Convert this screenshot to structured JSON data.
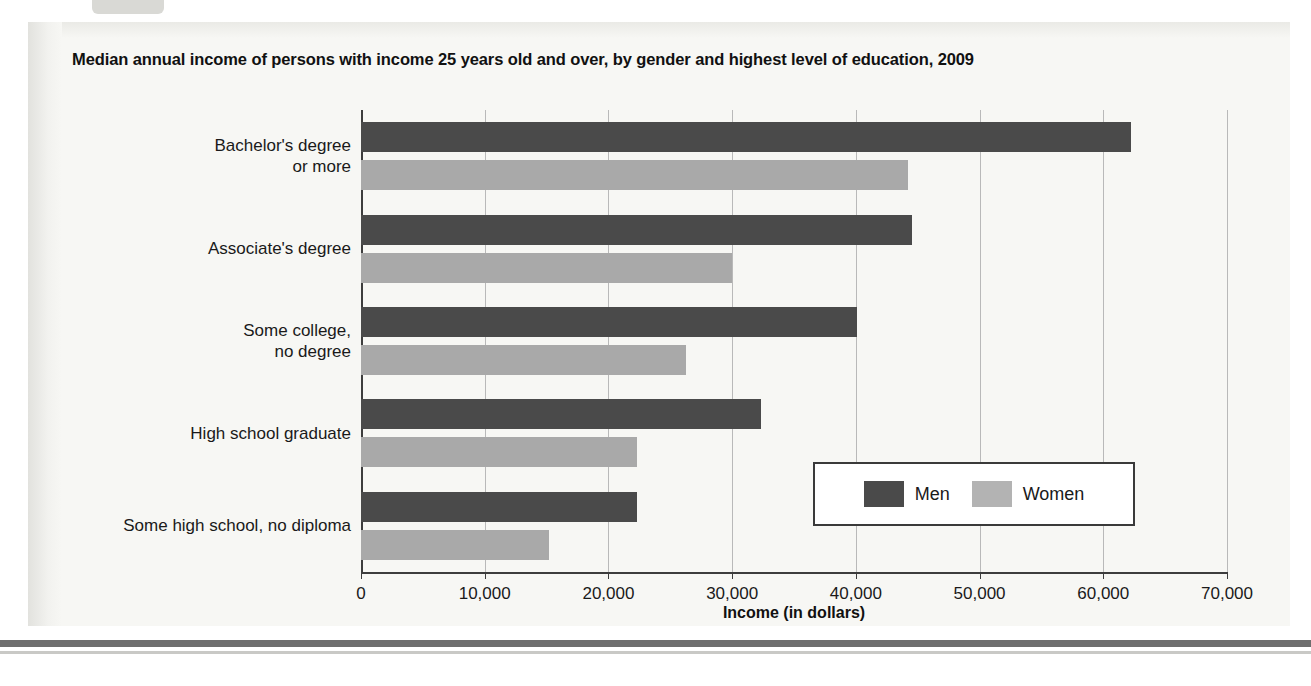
{
  "figure": {
    "title": "Median annual income of persons with income 25 years old and over, by gender and highest level of education, 2009"
  },
  "chart_data": {
    "type": "bar",
    "orientation": "horizontal",
    "title": "Median annual income of persons with income 25 years old and over, by gender and highest level of education, 2009",
    "xlabel": "Income (in dollars)",
    "ylabel": "",
    "xlim": [
      0,
      70000
    ],
    "xticks": [
      0,
      10000,
      20000,
      30000,
      40000,
      50000,
      60000,
      70000
    ],
    "xtick_labels": [
      "0",
      "10,000",
      "20,000",
      "30,000",
      "40,000",
      "50,000",
      "60,000",
      "70,000"
    ],
    "grid": true,
    "grid_axis": "x",
    "legend": [
      "Men",
      "Women"
    ],
    "legend_position": "inside lower right",
    "categories": [
      "Bachelor's degree\nor more",
      "Associate's degree",
      "Some college,\nno degree",
      "High school graduate",
      "Some high school, no diploma"
    ],
    "series": [
      {
        "name": "Men",
        "color": "#4a4a4a",
        "values": [
          62200,
          44500,
          40100,
          32300,
          22300
        ]
      },
      {
        "name": "Women",
        "color": "#a9a9a9",
        "values": [
          44200,
          30000,
          26300,
          22300,
          15200
        ]
      }
    ]
  }
}
